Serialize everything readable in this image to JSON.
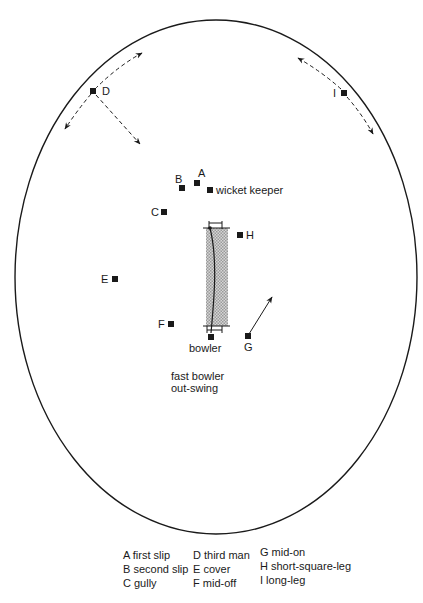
{
  "diagram": {
    "type": "cricket field placement",
    "caption": {
      "line1": "fast bowler",
      "line2": "out-swing"
    },
    "colors": {
      "line": "#1a1a1a",
      "pitch": "#b8b8b8",
      "background": "#ffffff"
    },
    "field_boundary": {
      "cx": 216,
      "cy": 276,
      "rx": 201,
      "ry": 257
    },
    "fielders": [
      {
        "id": "A",
        "label": "A",
        "x": 197,
        "y": 183
      },
      {
        "id": "B",
        "label": "B",
        "x": 182,
        "y": 188
      },
      {
        "id": "wk",
        "label": "wicket keeper",
        "x": 210,
        "y": 190
      },
      {
        "id": "C",
        "label": "C",
        "x": 164,
        "y": 212
      },
      {
        "id": "D",
        "label": "D",
        "x": 93,
        "y": 91
      },
      {
        "id": "E",
        "label": "E",
        "x": 115,
        "y": 279
      },
      {
        "id": "F",
        "label": "F",
        "x": 171,
        "y": 324
      },
      {
        "id": "G",
        "label": "G",
        "x": 248,
        "y": 336
      },
      {
        "id": "H",
        "label": "H",
        "x": 240,
        "y": 235
      },
      {
        "id": "I",
        "label": "I",
        "x": 344,
        "y": 93
      },
      {
        "id": "bowler",
        "label": "bowler",
        "x": 211,
        "y": 337
      }
    ],
    "legend": [
      [
        "A first slip",
        "B second slip",
        "C gully"
      ],
      [
        "D third man",
        "E cover",
        "F mid-off"
      ],
      [
        "G mid-on",
        "H short-square-leg",
        "I long-leg"
      ]
    ]
  }
}
